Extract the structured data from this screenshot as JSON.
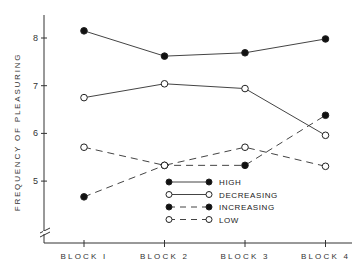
{
  "chart_data": {
    "type": "line",
    "title": "",
    "xlabel": "",
    "ylabel": "FREQUENCY OF PLEASURING",
    "categories": [
      "BLOCK I",
      "BLOCK 2",
      "BLOCK 3",
      "BLOCK 4"
    ],
    "yticks": [
      "5",
      "6",
      "7",
      "8"
    ],
    "ylim": [
      4,
      8.5
    ],
    "axis_break": true,
    "grid": false,
    "legend_position": "bottom-center",
    "series": [
      {
        "name": "HIGH",
        "marker": "filled",
        "linestyle": "solid",
        "values": [
          8.15,
          7.62,
          7.69,
          7.98
        ]
      },
      {
        "name": "DECREASING",
        "marker": "open",
        "linestyle": "solid",
        "values": [
          6.75,
          7.04,
          6.94,
          5.96
        ]
      },
      {
        "name": "INCREASING",
        "marker": "filled",
        "linestyle": "dashed",
        "values": [
          4.67,
          5.33,
          5.33,
          6.38
        ]
      },
      {
        "name": "LOW",
        "marker": "open",
        "linestyle": "dashed",
        "values": [
          5.71,
          5.33,
          5.71,
          5.31
        ]
      }
    ]
  }
}
